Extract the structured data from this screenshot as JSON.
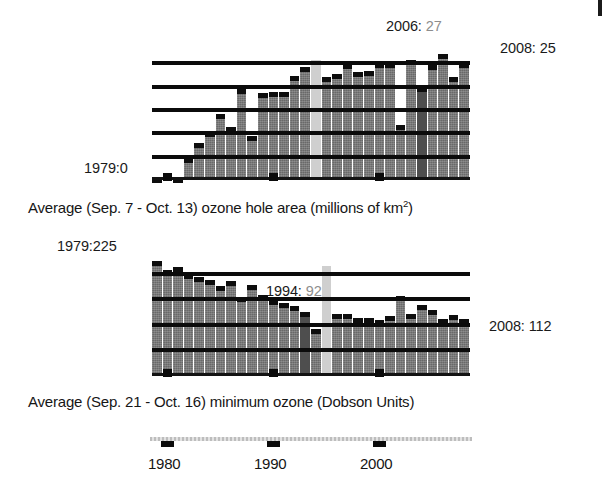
{
  "figure": {
    "artifact_icon": "scan-mark",
    "colors": {
      "bar": "#767676",
      "bar_missing": "#cfcfcf",
      "gridline": "#0b0b0b",
      "axis": "#c9c9c9",
      "text": "#1a1a1a",
      "text_dim": "#8d8d8d"
    }
  },
  "charts": [
    {
      "id": "ozone-hole-area",
      "caption_prefix": "Average (Sep. 7 - Oct. 13) ozone hole area (millions of km",
      "caption_sup": "2",
      "caption_suffix": ")",
      "annotations": [
        {
          "name": "first-year",
          "text": "1979:0",
          "value_text": ""
        },
        {
          "name": "peak-year",
          "text": "2006:",
          "value_text": " 27"
        },
        {
          "name": "last-year",
          "text": "2008: 25",
          "value_text": ""
        }
      ]
    },
    {
      "id": "minimum-ozone",
      "caption_prefix": "Average (Sep. 21 - Oct. 16) minimum ozone (Dobson Units)",
      "caption_sup": "",
      "caption_suffix": "",
      "annotations": [
        {
          "name": "first-year",
          "text": "1979:225",
          "value_text": ""
        },
        {
          "name": "min-year",
          "text": "1994:",
          "value_text": " 92"
        },
        {
          "name": "last-year",
          "text": "2008: 112",
          "value_text": ""
        }
      ]
    }
  ],
  "axis": {
    "tick_labels": [
      "1980",
      "1990",
      "2000"
    ],
    "tick_years": [
      1980,
      1990,
      2000
    ],
    "year_start": 1979,
    "year_end": 2008
  },
  "chart_data": [
    {
      "type": "bar",
      "id": "ozone-hole-area",
      "title": "Average (Sep. 7 - Oct. 13) ozone hole area (millions of km2)",
      "xlabel": "Year",
      "ylabel": "Ozone hole area (millions of km^2)",
      "ylim": [
        0,
        30
      ],
      "grid": true,
      "gridlines": [
        5,
        10,
        15,
        20,
        25
      ],
      "legend": "none",
      "categories": [
        1979,
        1980,
        1981,
        1982,
        1983,
        1984,
        1985,
        1986,
        1987,
        1988,
        1989,
        1990,
        1991,
        1992,
        1993,
        1994,
        1995,
        1996,
        1997,
        1998,
        1999,
        2000,
        2001,
        2002,
        2003,
        2004,
        2005,
        2006,
        2007,
        2008
      ],
      "values": [
        0.1,
        1.1,
        0.2,
        4.8,
        7.9,
        10.2,
        14.1,
        11.3,
        19.4,
        9.5,
        18.6,
        18.9,
        18.9,
        22.3,
        24.3,
        null,
        22.1,
        22.8,
        24.9,
        23.2,
        23.4,
        25.1,
        25.0,
        11.8,
        25.8,
        20.0,
        24.6,
        27.0,
        22.0,
        25.0
      ],
      "missing_years": [
        1995
      ],
      "annotations": [
        {
          "label": "1979:0",
          "year": 1979,
          "value": 0
        },
        {
          "label": "2006: 27",
          "year": 2006,
          "value": 27
        },
        {
          "label": "2008: 25",
          "year": 2008,
          "value": 25
        }
      ]
    },
    {
      "type": "bar",
      "id": "minimum-ozone",
      "title": "Average (Sep. 21 - Oct. 16) minimum ozone (Dobson Units)",
      "xlabel": "Year",
      "ylabel": "Minimum ozone (Dobson Units)",
      "ylim": [
        0,
        250
      ],
      "grid": true,
      "gridlines": [
        50,
        100,
        150,
        200
      ],
      "legend": "none",
      "categories": [
        1979,
        1980,
        1981,
        1982,
        1983,
        1984,
        1985,
        1986,
        1987,
        1988,
        1989,
        1990,
        1991,
        1992,
        1993,
        1994,
        1995,
        1996,
        1997,
        1998,
        1999,
        2000,
        2001,
        2002,
        2003,
        2004,
        2005,
        2006,
        2007,
        2008
      ],
      "values": [
        225,
        208,
        212,
        200,
        193,
        188,
        176,
        185,
        155,
        178,
        159,
        148,
        143,
        136,
        126,
        92,
        null,
        122,
        122,
        114,
        113,
        109,
        117,
        157,
        122,
        139,
        128,
        111,
        120,
        112
      ],
      "missing_years": [
        1995
      ],
      "annotations": [
        {
          "label": "1979:225",
          "year": 1979,
          "value": 225
        },
        {
          "label": "1994: 92",
          "year": 1994,
          "value": 92
        },
        {
          "label": "2008: 112",
          "year": 2008,
          "value": 112
        }
      ]
    }
  ]
}
